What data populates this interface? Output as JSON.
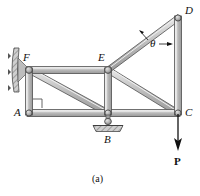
{
  "figure": {
    "caption": "(a)",
    "background_color": "#ffffff",
    "member_fill": "#b9b9b9",
    "member_highlight": "#e8e8e8",
    "member_stroke": "#4a4a4a",
    "ink_color": "#111111",
    "width": 200,
    "height": 196
  },
  "joints": [
    {
      "id": "A",
      "label": "A",
      "x": 29,
      "y": 113,
      "label_x": 14,
      "label_y": 107
    },
    {
      "id": "B",
      "label": "B",
      "x": 108,
      "y": 113,
      "label_x": 104,
      "label_y": 134
    },
    {
      "id": "C",
      "label": "C",
      "x": 178,
      "y": 113,
      "label_x": 185,
      "label_y": 107
    },
    {
      "id": "D",
      "label": "D",
      "x": 178,
      "y": 18,
      "label_x": 185,
      "label_y": 6
    },
    {
      "id": "E",
      "label": "E",
      "x": 108,
      "y": 70,
      "label_x": 98,
      "label_y": 53
    },
    {
      "id": "F",
      "label": "F",
      "x": 29,
      "y": 70,
      "label_x": 22,
      "label_y": 53
    }
  ],
  "members": [
    {
      "name": "member-A-C",
      "from": "A",
      "to": "C"
    },
    {
      "name": "member-F-E",
      "from": "F",
      "to": "E"
    },
    {
      "name": "member-A-F",
      "from": "A",
      "to": "F"
    },
    {
      "name": "member-B-E",
      "from": "B",
      "to": "E"
    },
    {
      "name": "member-C-D",
      "from": "C",
      "to": "D"
    },
    {
      "name": "member-F-B",
      "from": "F",
      "to": "B"
    },
    {
      "name": "member-E-C",
      "from": "E",
      "to": "C"
    },
    {
      "name": "member-E-D",
      "from": "E",
      "to": "D"
    }
  ],
  "annotations": {
    "angle_symbol": "θ",
    "angle_label_x": 150,
    "angle_label_y": 43,
    "load_label": "P",
    "load_label_x": 174,
    "load_label_y": 158,
    "right_angle_marker_at": "A"
  },
  "supports": {
    "wall": {
      "name": "wall-support-F",
      "description": "fixed hatched wall plate at F",
      "x": 12,
      "y": 47,
      "height": 44
    },
    "pin": {
      "name": "pin-support-B",
      "description": "pinned hatched ground support at B",
      "x": 108,
      "y": 118
    }
  }
}
